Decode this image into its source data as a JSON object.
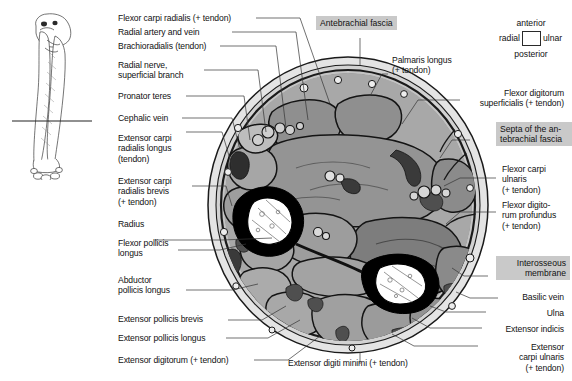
{
  "figure": {
    "orientation_key": {
      "anterior": "anterior",
      "posterior": "posterior",
      "radial": "radial",
      "ulnar": "ulnar"
    },
    "highlight_boxes": [
      {
        "text": "Antebrachial fascia"
      },
      {
        "text": "Septa of the an-\ntebrachial fascia"
      },
      {
        "text": "Interosseous\nmembrane"
      }
    ],
    "labels_left": [
      {
        "text": "Flexor carpi radialis (+ tendon)"
      },
      {
        "text": "Radial artery and vein"
      },
      {
        "text": "Brachioradialis (tendon)"
      },
      {
        "text": "Radial nerve,\nsuperficial branch"
      },
      {
        "text": "Pronator teres"
      },
      {
        "text": "Cephalic vein"
      },
      {
        "text": "Extensor carpi\nradialis longus\n(tendon)"
      },
      {
        "text": "Extensor carpi\nradialis brevis\n(+ tendon)"
      },
      {
        "text": "Radius"
      },
      {
        "text": "Flexor pollicis\nlongus"
      },
      {
        "text": "Abductor\npollicis longus"
      },
      {
        "text": "Extensor pollicis brevis"
      },
      {
        "text": "Extensor pollicis longus"
      },
      {
        "text": "Extensor digitorum (+ tendon)"
      }
    ],
    "labels_right": [
      {
        "text": "Palmaris longus\n(+ tendon)"
      },
      {
        "text": "Flexor digitorum\nsuperficialis (+ tendon)"
      },
      {
        "text": "Flexor carpi\nulnaris\n(+ tendon)"
      },
      {
        "text": "Flexor digito-\nrum profundus\n(+ tendon)"
      },
      {
        "text": "Basilic vein"
      },
      {
        "text": "Ulna"
      },
      {
        "text": "Extensor indicis"
      },
      {
        "text": "Extensor\ncarpi ulnaris\n(+ tendon)"
      }
    ],
    "labels_bottom": [
      {
        "text": "Extensor digiti minimi (+ tendon)"
      }
    ],
    "colors": {
      "background": "#ffffff",
      "highlight": "#c9c9c9",
      "fascia_ring": "#d9d9d9",
      "muscle_light": "#b2b2b2",
      "muscle_mid": "#9a9a9a",
      "muscle_dark": "#7e7e7e",
      "bone_cortex": "#000000",
      "bone_marrow": "#ffffff",
      "outline": "#1a1a1a",
      "leader": "#333333"
    }
  }
}
